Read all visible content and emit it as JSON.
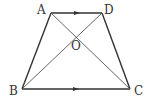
{
  "figure": {
    "type": "trapezoid",
    "stroke_color": "#333333",
    "diagonal_color": "#555555",
    "vertices": {
      "A": {
        "label": "A",
        "x": 51,
        "y": 13
      },
      "D": {
        "label": "D",
        "x": 102,
        "y": 13
      },
      "B": {
        "label": "B",
        "x": 22,
        "y": 89
      },
      "C": {
        "label": "C",
        "x": 130,
        "y": 89
      },
      "O": {
        "label": "O",
        "x": 77,
        "y": 35
      }
    },
    "parallel_marks": [
      "AD",
      "BC"
    ]
  }
}
